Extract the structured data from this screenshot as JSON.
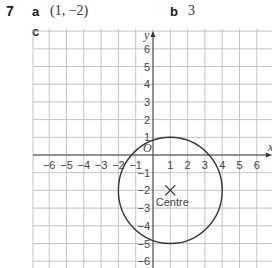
{
  "question": {
    "number": "7",
    "parts": [
      {
        "label": "a",
        "answer": "(1, −2)"
      },
      {
        "label": "b",
        "answer": "3"
      },
      {
        "label": "c",
        "answer": ""
      }
    ]
  },
  "graph": {
    "x_axis_label": "x",
    "y_axis_label": "y",
    "origin_label": "O",
    "x_ticks": [
      "−6",
      "−5",
      "−4",
      "−3",
      "−2",
      "−1",
      "1",
      "2",
      "3",
      "4",
      "5",
      "6"
    ],
    "y_ticks": [
      "6",
      "5",
      "4",
      "3",
      "2",
      "1",
      "−1",
      "−2",
      "−3",
      "−4",
      "−5",
      "−6"
    ],
    "circle": {
      "center": [
        1,
        -2
      ],
      "radius": 3
    },
    "marker": {
      "symbol": "×",
      "label": "Centre",
      "position": [
        1,
        -2
      ]
    }
  }
}
